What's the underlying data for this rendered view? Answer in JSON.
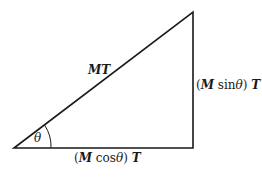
{
  "diagram": {
    "hypotenuse_label": "MT",
    "angle_label": "θ",
    "vertical_label": "(M sin θ) T",
    "horizontal_label": "(M cos θ) T",
    "vertices": {
      "left": [
        14,
        148
      ],
      "top_right": [
        193,
        12
      ],
      "bottom_right": [
        193,
        148
      ]
    },
    "stroke_color": "#1a1a1a"
  }
}
